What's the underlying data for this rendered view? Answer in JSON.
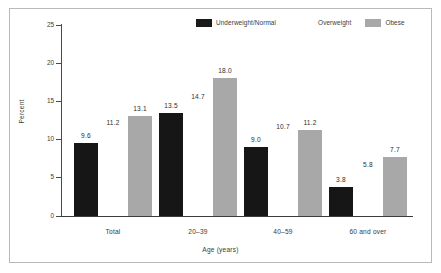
{
  "figure": {
    "background_color": "#ffffff",
    "frame_color": "#b9b9b9"
  },
  "legend": {
    "position": "top-right",
    "entries": [
      {
        "label": "Underweight/Normal",
        "swatch": "black",
        "color": "#161616"
      },
      {
        "label": "Overweight",
        "swatch": "white",
        "color": "#ffffff"
      },
      {
        "label": "Obese",
        "swatch": "gray",
        "color": "#a8a8a8"
      }
    ]
  },
  "axes": {
    "y_title": "Percent",
    "x_title": "Age (years)",
    "y_ticks": [
      "25",
      "20",
      "15",
      "10",
      "5",
      "0"
    ]
  },
  "chart_data": {
    "type": "bar",
    "title": "",
    "subtitle": "",
    "xlabel": "Age (years)",
    "ylabel": "Percent",
    "ylim": [
      0,
      25
    ],
    "ytick_step": 5,
    "grid": false,
    "legend_position": "top-right",
    "categories": [
      "Total",
      "20–39",
      "40–59",
      "60 and over"
    ],
    "series": [
      {
        "name": "Underweight/Normal",
        "color": "#161616",
        "values": [
          9.6,
          13.5,
          9.0,
          3.8
        ],
        "labels": [
          "9.6",
          "13.5",
          "9.0",
          "3.8"
        ]
      },
      {
        "name": "Overweight",
        "color": "#ffffff",
        "values": [
          11.2,
          14.7,
          10.7,
          5.8
        ],
        "labels": [
          "11.2",
          "14.7",
          "10.7",
          "5.8"
        ]
      },
      {
        "name": "Obese",
        "color": "#a8a8a8",
        "values": [
          13.1,
          18.0,
          11.2,
          7.7
        ],
        "labels": [
          "13.1",
          "18.0",
          "11.2",
          "7.7"
        ]
      }
    ]
  }
}
